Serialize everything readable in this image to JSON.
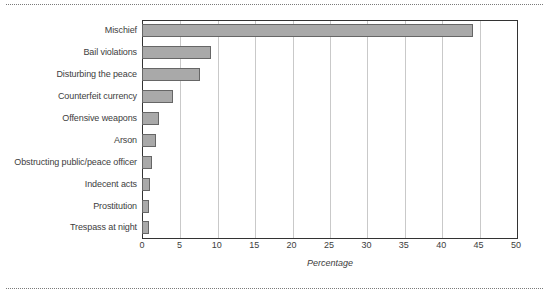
{
  "chart_data": {
    "type": "bar",
    "orientation": "horizontal",
    "title": "",
    "xlabel": "Percentage",
    "ylabel": "",
    "xlim": [
      0,
      50
    ],
    "xticks": [
      0,
      5,
      10,
      15,
      20,
      25,
      30,
      35,
      40,
      45,
      50
    ],
    "grid": "vertical",
    "legend": "none",
    "bar_fill": "#a9a9a9",
    "bar_edge": "#666666",
    "categories": [
      "Mischief",
      "Bail violations",
      "Disturbing the peace",
      "Counterfeit currency",
      "Offensive weapons",
      "Arson",
      "Obstructing public/peace officer",
      "Indecent acts",
      "Prostitution",
      "Trespass at night"
    ],
    "values": [
      44.3,
      9.2,
      7.7,
      4.2,
      2.3,
      1.9,
      1.3,
      1.1,
      1.0,
      1.0
    ]
  }
}
